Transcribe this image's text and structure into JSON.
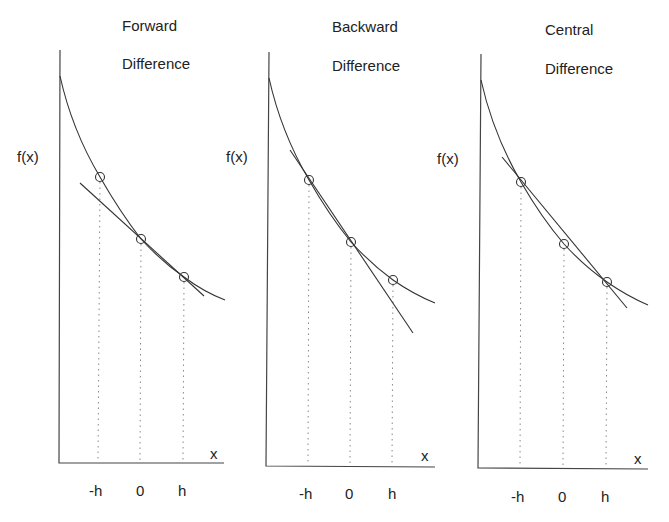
{
  "panels": [
    {
      "title_line1": "Forward",
      "title_line2": "Difference",
      "ylabel": "f(x)",
      "xlabel": "x",
      "ticks": [
        "-h",
        "0",
        "h"
      ]
    },
    {
      "title_line1": "Backward",
      "title_line2": "Difference",
      "ylabel": "f(x)",
      "xlabel": "x",
      "ticks": [
        "-h",
        "0",
        "h"
      ]
    },
    {
      "title_line1": "Central",
      "title_line2": "Difference",
      "ylabel": "f(x)",
      "xlabel": "x",
      "ticks": [
        "-h",
        "0",
        "h"
      ]
    }
  ],
  "colors": {
    "line": "#333333",
    "axis": "#444444",
    "guide": "#888888",
    "background": "#ffffff"
  }
}
